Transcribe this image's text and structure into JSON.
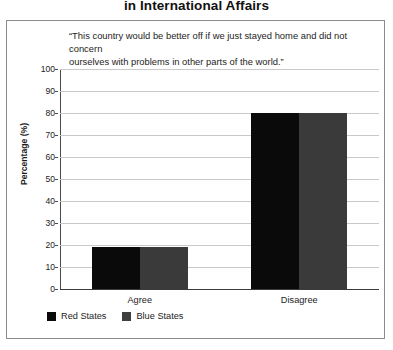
{
  "title": "in International Affairs",
  "quote": {
    "line1": "“This country would be better off if we just stayed home and did not concern",
    "line2": "ourselves with problems in other parts of the world.”"
  },
  "legend": {
    "items": [
      {
        "label": "Red States",
        "color": "#0a0a0a",
        "swatch": "red-states-swatch"
      },
      {
        "label": "Blue States",
        "color": "#3f3f3f",
        "swatch": "blue-states-swatch"
      }
    ]
  },
  "axis": {
    "y_title": "Percentage (%)",
    "y_ticks": [
      "0",
      "10",
      "20",
      "30",
      "40",
      "50",
      "60",
      "70",
      "80",
      "90",
      "100"
    ],
    "x_ticks": [
      "Agree",
      "Disagree"
    ]
  },
  "chart_data": {
    "type": "bar",
    "title": "in International Affairs",
    "subtitle": "“This country would be better off if we just stayed home and did not concern ourselves with problems in other parts of the world.”",
    "categories": [
      "Agree",
      "Disagree"
    ],
    "series": [
      {
        "name": "Red States",
        "color": "#0a0a0a",
        "values": [
          19,
          80
        ]
      },
      {
        "name": "Blue States",
        "color": "#3a3a3a",
        "values": [
          19,
          80
        ]
      }
    ],
    "xlabel": "",
    "ylabel": "Percentage (%)",
    "ylim": [
      0,
      100
    ],
    "ytick_step": 10,
    "grid": true,
    "legend_position": "bottom-left"
  }
}
